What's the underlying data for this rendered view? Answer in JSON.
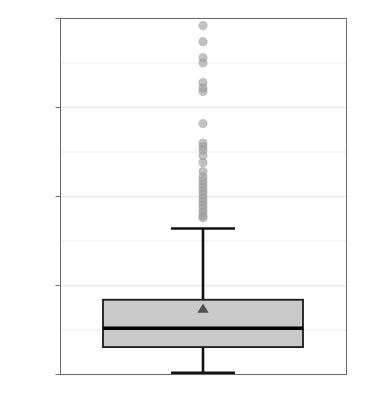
{
  "chart_data": {
    "type": "box",
    "title": "",
    "xlabel": "青年牛死淘率",
    "ylabel": "百分比（%）",
    "ylim": [
      0,
      100
    ],
    "yticks": [
      0,
      25,
      50,
      75,
      100
    ],
    "ytick_labels": [
      "0",
      "25",
      "50",
      "75",
      "100"
    ],
    "minor_gridlines": [
      12.5,
      37.5,
      62.5,
      87.5
    ],
    "grid": true,
    "legend": "none",
    "categories": [
      "青年牛死淘率"
    ],
    "box": {
      "q1": 7.7,
      "median": 13,
      "q3": 21,
      "mean": 18,
      "whisker_low": 0.5,
      "whisker_high": 41
    },
    "annotations": [
      {
        "label": "21",
        "value": 21
      },
      {
        "label": "13",
        "value": 13
      },
      {
        "label": "7.7",
        "value": 7.7
      },
      {
        "label": "18",
        "value": 18
      }
    ],
    "outliers": [
      98,
      93.5,
      89,
      87.5,
      82,
      80.5,
      79.5,
      70.5,
      65,
      64,
      63,
      61.5,
      59.5,
      57,
      55.5,
      54.5,
      53.5,
      52.5,
      51.5,
      50.5,
      49.5,
      48.5,
      47.5,
      46.5,
      45.5,
      44.5,
      44
    ],
    "colors": {
      "box_fill": "#c9c9c9",
      "box_edge": "#1a1a1a",
      "median": "#000000",
      "whisker": "#111111",
      "mean_marker": "#4f4f4f",
      "outlier": "#9a9a9a",
      "grid": "#ebebeb",
      "panel_border": "#6b6b6b",
      "text": "#3b3b3b"
    }
  }
}
